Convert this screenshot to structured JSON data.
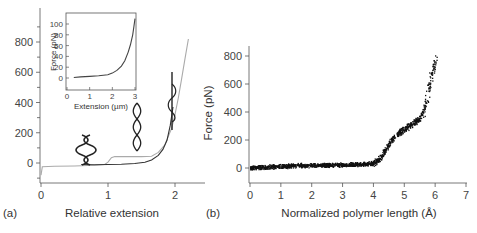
{
  "chart_data": [
    {
      "panel": "(a)",
      "type": "line",
      "title": "",
      "xlabel": "Relative extension",
      "ylabel": "",
      "xlim": [
        0,
        2.4
      ],
      "ylim": [
        -120,
        950
      ],
      "xticks": [
        "0",
        "1",
        "2"
      ],
      "yticks": [
        "0",
        "200",
        "400",
        "600",
        "800"
      ],
      "grid": false,
      "legend": null,
      "series": [
        {
          "name": "gray curve",
          "color": "#aaaaaa",
          "x": [
            0.0,
            0.02,
            0.2,
            0.5,
            0.8,
            0.95,
            1.0,
            1.05,
            1.1,
            1.3,
            1.5,
            1.65,
            1.75,
            1.85,
            1.95,
            2.0,
            2.05,
            2.1,
            2.15,
            2.2
          ],
          "y": [
            -80,
            -25,
            -22,
            -20,
            -15,
            -10,
            5,
            35,
            42,
            42,
            42,
            45,
            70,
            120,
            230,
            320,
            430,
            560,
            690,
            820
          ]
        },
        {
          "name": "dark curve",
          "color": "#333333",
          "x": [
            0.6,
            0.8,
            1.0,
            1.2,
            1.4,
            1.55,
            1.65,
            1.75,
            1.82,
            1.88,
            1.93,
            1.97
          ],
          "y": [
            -10,
            -12,
            -10,
            -8,
            -3,
            5,
            20,
            50,
            90,
            150,
            250,
            370
          ]
        }
      ],
      "annotations": [
        "B-DNA double helix glyph at x~0.75",
        "stretched helix glyph at x~1.4",
        "unwound helix glyph at x~1.95"
      ],
      "inset": {
        "type": "line",
        "xlabel": "Extension (µm)",
        "ylabel": "Force (pN)",
        "xlim": [
          0,
          3
        ],
        "ylim": [
          -5,
          115
        ],
        "xticks": [
          "0",
          "1",
          "2",
          "3"
        ],
        "yticks": [
          "0",
          "20",
          "40",
          "60",
          "80",
          "100"
        ],
        "series": [
          {
            "name": "inset curve",
            "x": [
              0.3,
              0.6,
              1.0,
              1.4,
              1.8,
              2.0,
              2.2,
              2.4,
              2.55,
              2.7,
              2.8,
              2.9,
              2.95,
              3.0
            ],
            "y": [
              1,
              2,
              3,
              4,
              6,
              9,
              14,
              22,
              32,
              48,
              62,
              80,
              95,
              110
            ]
          }
        ]
      }
    },
    {
      "panel": "(b)",
      "type": "scatter",
      "title": "",
      "xlabel": "Normalized polymer length (Å)",
      "ylabel": "Force (pN)",
      "xlim": [
        0,
        7
      ],
      "ylim": [
        -100,
        880
      ],
      "xticks": [
        "0",
        "1",
        "2",
        "3",
        "4",
        "5",
        "6",
        "7"
      ],
      "yticks": [
        "0",
        "200",
        "400",
        "600",
        "800"
      ],
      "grid": false,
      "legend": null,
      "series": [
        {
          "name": "data",
          "color": "#111111",
          "x": [
            0.0,
            0.5,
            1.0,
            1.5,
            2.0,
            2.5,
            3.0,
            3.5,
            3.8,
            4.0,
            4.2,
            4.4,
            4.6,
            4.8,
            5.0,
            5.2,
            5.4,
            5.5,
            5.6,
            5.7,
            5.8,
            5.9,
            6.0
          ],
          "y": [
            5,
            10,
            15,
            20,
            22,
            25,
            25,
            28,
            32,
            40,
            70,
            140,
            210,
            250,
            280,
            310,
            340,
            360,
            400,
            470,
            580,
            680,
            780
          ]
        }
      ]
    }
  ],
  "labels": {
    "panel_a": "(a)",
    "panel_b": "(b)",
    "a_xlabel": "Relative extension",
    "b_xlabel": "Normalized polymer length (Å)",
    "b_ylabel": "Force (pN)",
    "inset_xlabel": "Extension (µm)",
    "inset_ylabel": "Force (pN)",
    "a_xticks": [
      "0",
      "1",
      "2"
    ],
    "a_yticks": [
      "0",
      "200",
      "400",
      "600",
      "800"
    ],
    "b_xticks": [
      "0",
      "1",
      "2",
      "3",
      "4",
      "5",
      "6",
      "7"
    ],
    "b_yticks": [
      "0",
      "200",
      "400",
      "600",
      "800"
    ],
    "inset_xticks": [
      "0",
      "1",
      "2",
      "3"
    ],
    "inset_yticks": [
      "0",
      "20",
      "40",
      "60",
      "80",
      "100"
    ]
  }
}
